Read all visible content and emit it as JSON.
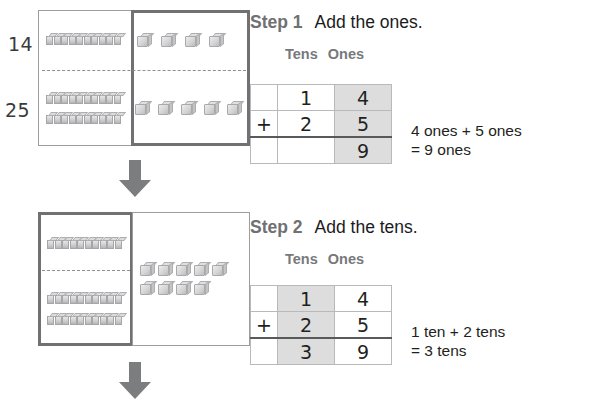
{
  "worksheet": {
    "title": "Adding two-digit numbers with base-ten blocks",
    "arrow_icon": "down-arrow-icon"
  },
  "steps": [
    {
      "id": "step-1",
      "label": "Step 1",
      "instruction": "Add the ones.",
      "headers": {
        "tens": "Tens",
        "ones": "Ones"
      },
      "highlight_column": "ones",
      "table": {
        "rows": [
          {
            "sign": "",
            "tens": "1",
            "ones": "4"
          },
          {
            "sign": "+",
            "tens": "2",
            "ones": "5"
          },
          {
            "sign": "",
            "tens": "",
            "ones": "9"
          }
        ]
      },
      "note_line1": "4 ones + 5 ones",
      "note_line2": "= 9 ones",
      "diagram": {
        "emphasis": "ones",
        "addend_top": "14",
        "addend_bottom": "25",
        "top_row": {
          "tens_rods": 1,
          "ones_cubes": 4
        },
        "bottom_row": {
          "tens_rods": 2,
          "ones_cubes": 5
        }
      }
    },
    {
      "id": "step-2",
      "label": "Step 2",
      "instruction": "Add the tens.",
      "headers": {
        "tens": "Tens",
        "ones": "Ones"
      },
      "highlight_column": "tens",
      "table": {
        "rows": [
          {
            "sign": "",
            "tens": "1",
            "ones": "4"
          },
          {
            "sign": "+",
            "tens": "2",
            "ones": "5"
          },
          {
            "sign": "",
            "tens": "3",
            "ones": "9"
          }
        ]
      },
      "note_line1": "1 ten + 2 tens",
      "note_line2": "= 3 tens",
      "diagram": {
        "emphasis": "tens",
        "addend_top": "",
        "addend_bottom": "",
        "top_row": {
          "tens_rods": 1,
          "ones_cubes": 0
        },
        "bottom_row": {
          "tens_rods": 2,
          "ones_cubes": 0
        },
        "combined_ones": 9
      }
    }
  ],
  "colors": {
    "block_gray": "#cfcfd0",
    "emphasis_border": "#6f7173",
    "plain_border": "#9d9d9f",
    "shade": "#dddddd",
    "arrow": "#7b7d7f",
    "heading_gray": "#6f7173"
  }
}
